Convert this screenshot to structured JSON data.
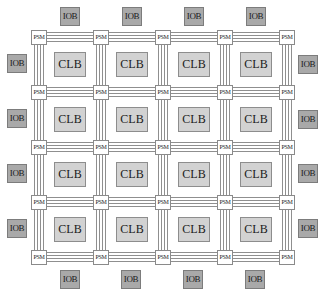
{
  "diagram": {
    "labels": {
      "psm": "PSM",
      "clb": "CLB",
      "iob": "IOB"
    },
    "colors": {
      "background": "#ffffff",
      "iob_fill": "#a9a9a9",
      "clb_fill": "#d2d2d2",
      "psm_fill": "#ffffff",
      "wire": "#8f8f8f",
      "border": "#8a8a8a"
    },
    "grid": {
      "psm_rows": 5,
      "psm_cols": 5,
      "clb_rows": 4,
      "clb_cols": 4,
      "wires_per_channel": 4
    },
    "psms": [
      [
        "PSM",
        "PSM",
        "PSM",
        "PSM",
        "PSM"
      ],
      [
        "PSM",
        "PSM",
        "PSM",
        "PSM",
        "PSM"
      ],
      [
        "PSM",
        "PSM",
        "PSM",
        "PSM",
        "PSM"
      ],
      [
        "PSM",
        "PSM",
        "PSM",
        "PSM",
        "PSM"
      ],
      [
        "PSM",
        "PSM",
        "PSM",
        "PSM",
        "PSM"
      ]
    ],
    "clbs": [
      [
        "CLB",
        "CLB",
        "CLB",
        "CLB"
      ],
      [
        "CLB",
        "CLB",
        "CLB",
        "CLB"
      ],
      [
        "CLB",
        "CLB",
        "CLB",
        "CLB"
      ],
      [
        "CLB",
        "CLB",
        "CLB",
        "CLB"
      ]
    ],
    "iobs": {
      "top": [
        "IOB",
        "IOB",
        "IOB",
        "IOB"
      ],
      "bottom": [
        "IOB",
        "IOB",
        "IOB",
        "IOB"
      ],
      "left": [
        "IOB",
        "IOB",
        "IOB",
        "IOB"
      ],
      "right": [
        "IOB",
        "IOB",
        "IOB",
        "IOB"
      ]
    }
  }
}
